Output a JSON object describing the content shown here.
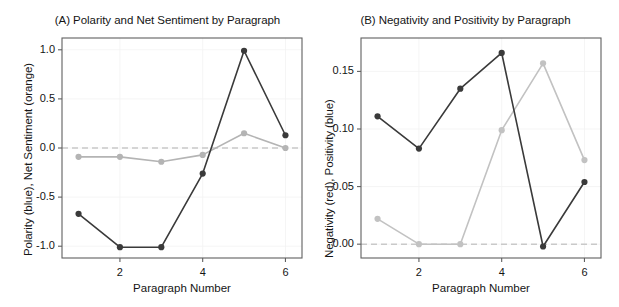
{
  "figure": {
    "background_color": "#ffffff",
    "text_color": "#151515"
  },
  "chart_data": [
    {
      "panel": "A",
      "type": "line",
      "title": "(A) Polarity and Net Sentiment by Paragraph",
      "xlabel": "Paragraph Number",
      "ylabel": "Polarity (blue), Net Sentiment (orange)",
      "x": [
        1,
        2,
        3,
        4,
        5,
        6
      ],
      "xtick_labels": [
        "2",
        "4",
        "6"
      ],
      "xtick_values": [
        2,
        4,
        6
      ],
      "ytick_labels": [
        "1.0",
        "0.5",
        "0.0",
        "-0.5",
        "-1.0"
      ],
      "ytick_values": [
        1.0,
        0.5,
        0.0,
        -0.5,
        -1.0
      ],
      "xlim": [
        0.6,
        6.4
      ],
      "ylim": [
        -1.12,
        1.12
      ],
      "grid": true,
      "legend": "none",
      "reference_line": {
        "y": 0.0,
        "style": "dashed",
        "color": "#c9c9c9"
      },
      "series": [
        {
          "name": "Polarity (blue)",
          "color": "#3a3a3a",
          "marker": "circle",
          "values": [
            -0.67,
            -1.01,
            -1.01,
            -0.26,
            0.99,
            0.13
          ]
        },
        {
          "name": "Net Sentiment (orange)",
          "color": "#b4b4b4",
          "marker": "circle",
          "values": [
            -0.09,
            -0.09,
            -0.14,
            -0.07,
            0.15,
            0.0
          ]
        }
      ]
    },
    {
      "panel": "B",
      "type": "line",
      "title": "(B) Negativity and Positivity by Paragraph",
      "xlabel": "Paragraph Number",
      "ylabel": "Negativity (red), Positivity (blue)",
      "x": [
        1,
        2,
        3,
        4,
        5,
        6
      ],
      "xtick_labels": [
        "2",
        "4",
        "6"
      ],
      "xtick_values": [
        2,
        4,
        6
      ],
      "ytick_labels": [
        "0.15",
        "0.10",
        "0.05",
        "0.00"
      ],
      "ytick_values": [
        0.15,
        0.1,
        0.05,
        0.0
      ],
      "xlim": [
        0.6,
        6.4
      ],
      "ylim": [
        -0.012,
        0.179
      ],
      "grid": true,
      "legend": "none",
      "reference_line": {
        "y": 0.0,
        "style": "dashed",
        "color": "#c9c9c9"
      },
      "series": [
        {
          "name": "Negativity (red)",
          "color": "#3a3a3a",
          "marker": "circle",
          "values": [
            0.111,
            0.083,
            0.135,
            0.166,
            -0.002,
            0.054
          ]
        },
        {
          "name": "Positivity (blue)",
          "color": "#c2c2c2",
          "marker": "circle",
          "values": [
            0.022,
            0.0,
            0.0,
            0.099,
            0.157,
            0.073
          ]
        }
      ]
    }
  ]
}
